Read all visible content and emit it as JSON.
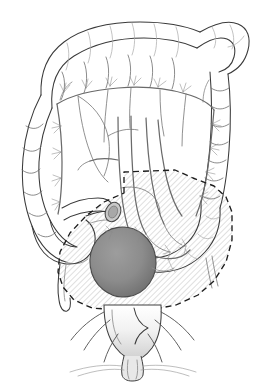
{
  "figure": {
    "background_color": "#ffffff",
    "line_color": "#3a3a3a",
    "vessel_color": "#6a6a6a",
    "resection_margin_color": "#1d1d1d",
    "hatch_fill_color": "#d9d9d9",
    "tumor_fill_color": "#8a8a8a",
    "tumor_edge_color": "#4a4a4a",
    "canvas": {
      "width": 259,
      "height": 384
    }
  },
  "structures": [
    {
      "id": "transverse-colon",
      "label": "Transverse colon",
      "region": "superior",
      "inside_resection": false
    },
    {
      "id": "hepatic-flexure",
      "label": "Hepatic flexure",
      "region": "upper-left",
      "inside_resection": false
    },
    {
      "id": "splenic-flexure",
      "label": "Splenic flexure",
      "region": "upper-right",
      "inside_resection": false
    },
    {
      "id": "ascending-colon",
      "label": "Ascending colon",
      "region": "left",
      "inside_resection": false
    },
    {
      "id": "descending-colon",
      "label": "Descending colon",
      "region": "right",
      "inside_resection": false
    },
    {
      "id": "cecum",
      "label": "Cecum",
      "region": "lower-left",
      "inside_resection": false
    },
    {
      "id": "appendix",
      "label": "Appendix",
      "region": "lower-left",
      "inside_resection": false
    },
    {
      "id": "terminal-ileum",
      "label": "Terminal ileum",
      "region": "lower-left",
      "inside_resection": false
    },
    {
      "id": "sigmoid-colon",
      "label": "Sigmoid colon",
      "region": "lower-right",
      "inside_resection": true
    },
    {
      "id": "rectum",
      "label": "Rectum",
      "region": "inferior",
      "inside_resection": true
    },
    {
      "id": "anal-canal",
      "label": "Anal canal",
      "region": "inferior",
      "inside_resection": false
    },
    {
      "id": "levator-ani",
      "label": "Levator ani muscle",
      "region": "inferior",
      "inside_resection": false
    },
    {
      "id": "mesenteric-arcade",
      "label": "Mesenteric vascular arcade",
      "region": "central",
      "inside_resection": false
    },
    {
      "id": "marginal-artery",
      "label": "Marginal artery",
      "region": "peripheral",
      "inside_resection": false
    },
    {
      "id": "inferior-mesenteric-vessels",
      "label": "Inferior mesenteric vessels",
      "region": "central",
      "inside_resection": true
    },
    {
      "id": "tumor",
      "label": "Tumor mass",
      "region": "rectosigmoid",
      "inside_resection": true
    },
    {
      "id": "bowel-transection",
      "label": "Proximal bowel transection end",
      "region": "mid-left",
      "inside_resection": false
    }
  ],
  "annotations": {
    "resection_field": {
      "name": "Resection field",
      "style": "dashed outline with diagonal hatching",
      "contains": [
        "sigmoid-colon",
        "rectum",
        "tumor",
        "inferior-mesenteric-vessels"
      ]
    },
    "tumor": {
      "name": "Tumor",
      "style": "solid gray shaded mass",
      "location": "rectosigmoid junction"
    },
    "transection": {
      "name": "Transection site",
      "style": "open stippled bowel lumen ellipse"
    }
  },
  "labels": []
}
